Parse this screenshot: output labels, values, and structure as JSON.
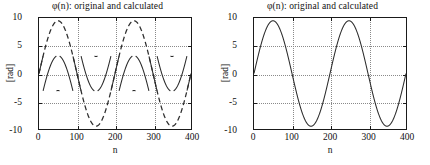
{
  "figure": {
    "background": "#ffffff",
    "line_color": "#2b2b2b",
    "grid_color": "#8a8a8a",
    "axis_color": "#1a1a1a"
  },
  "panels": [
    {
      "id": "left",
      "title": "φ(n): original and calculated",
      "xlabel": "n",
      "ylabel": "[rad]",
      "xticks": [
        "0",
        "100",
        "200",
        "300",
        "400"
      ],
      "yticks": [
        "10",
        "5",
        "0",
        "-5",
        "-10"
      ]
    },
    {
      "id": "right",
      "title": "φ(n): original and calculated",
      "xlabel": "n",
      "ylabel": "[rad]",
      "xticks": [
        "0",
        "100",
        "200",
        "300",
        "400"
      ],
      "yticks": [
        "10",
        "5",
        "0",
        "-5",
        "-10"
      ]
    }
  ],
  "chart_data": [
    {
      "type": "line",
      "id": "left-plot",
      "title": "φ(n): original and calculated",
      "xlabel": "n",
      "ylabel": "[rad]",
      "xlim": [
        0,
        400
      ],
      "ylim": [
        -10,
        10
      ],
      "xticks": [
        0,
        100,
        200,
        300,
        400
      ],
      "yticks": [
        -10,
        -5,
        0,
        5,
        10
      ],
      "grid": true,
      "grid_style": "dotted",
      "legend": null,
      "series": [
        {
          "name": "original (unwrapped phase)",
          "style": "dashed",
          "formula": "9.5*sin(2*pi*n/200)",
          "amplitude": 9.5,
          "period": 200,
          "phase": 0,
          "x": [
            0,
            25,
            50,
            75,
            100,
            125,
            150,
            175,
            200,
            225,
            250,
            275,
            300,
            325,
            350,
            375,
            400
          ],
          "values": [
            0,
            6.72,
            9.5,
            6.72,
            0,
            -6.72,
            -9.5,
            -6.72,
            0,
            6.72,
            9.5,
            6.72,
            0,
            -6.72,
            -9.5,
            -6.72,
            0
          ]
        },
        {
          "name": "calculated (wrapped phase, mod 2π)",
          "style": "solid",
          "formula": "wrap(9.5*sin(2*pi*n/200)) in (-pi, pi]",
          "amplitude": 3.14,
          "period": 200,
          "wrap_limit": 3.14159,
          "x": [
            0,
            25,
            50,
            75,
            100,
            125,
            150,
            175,
            200,
            225,
            250,
            275,
            300,
            325,
            350,
            375,
            400
          ],
          "values": [
            0,
            0.44,
            3.08,
            0.44,
            0,
            -0.44,
            -3.08,
            -0.44,
            0,
            0.44,
            3.08,
            0.44,
            0,
            -0.44,
            -3.08,
            -0.44,
            0
          ]
        }
      ]
    },
    {
      "type": "line",
      "id": "right-plot",
      "title": "φ(n): original and calculated",
      "xlabel": "n",
      "ylabel": "[rad]",
      "xlim": [
        0,
        400
      ],
      "ylim": [
        -10,
        10
      ],
      "xticks": [
        0,
        100,
        200,
        300,
        400
      ],
      "yticks": [
        -10,
        -5,
        0,
        5,
        10
      ],
      "grid": true,
      "grid_style": "dotted",
      "legend": null,
      "series": [
        {
          "name": "original and calculated (overlapping)",
          "style": "solid",
          "formula": "9.5*sin(2*pi*n/200)",
          "amplitude": 9.5,
          "period": 200,
          "phase": 0,
          "x": [
            0,
            25,
            50,
            75,
            100,
            125,
            150,
            175,
            200,
            225,
            250,
            275,
            300,
            325,
            350,
            375,
            400
          ],
          "values": [
            0,
            6.72,
            9.5,
            6.72,
            0,
            -6.72,
            -9.5,
            -6.72,
            0,
            6.72,
            9.5,
            6.72,
            0,
            -6.72,
            -9.5,
            -6.72,
            0
          ]
        }
      ]
    }
  ]
}
